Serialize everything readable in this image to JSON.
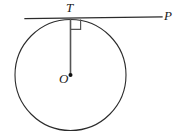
{
  "figure": {
    "width": 191,
    "height": 134,
    "background_color": "#ffffff",
    "stroke_color": "#2b2b2b"
  },
  "labels": {
    "tangent_point": "T",
    "center": "O",
    "line_end": "P"
  },
  "geometry": {
    "circle": {
      "cx": 70.5,
      "cy": 75,
      "r": 55.5,
      "stroke": "#2b2b2b",
      "stroke_width": 1.1,
      "fill": "none"
    },
    "tangent_line": {
      "x1": 25,
      "y1": 18.6,
      "x2": 162,
      "y2": 16.8,
      "stroke": "#2b2b2b",
      "stroke_width": 1.3
    },
    "radius_segment": {
      "x1": 70.5,
      "y1": 19.5,
      "x2": 70.5,
      "y2": 75,
      "stroke": "#555555",
      "stroke_width": 1.6
    },
    "right_angle_marker": {
      "points": "70.9,29.4 80.6,29.4 80.6,19.4",
      "stroke": "#555555",
      "stroke_width": 1.2,
      "fill": "none"
    },
    "center_point": {
      "cx": 70.5,
      "cy": 75,
      "r": 2.0,
      "fill": "#111111"
    }
  }
}
